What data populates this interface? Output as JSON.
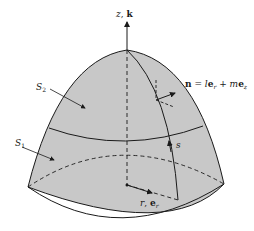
{
  "diagram": {
    "colors": {
      "surface_fill": "#c8c8c8",
      "lines": "#1a1a1a",
      "background": "#ffffff"
    },
    "labels": {
      "axis": "z, k",
      "axis_z": "z",
      "axis_k": "k",
      "normal": "n = le",
      "normal_full": "n = l e_r + m e_z",
      "normal_n": "n",
      "normal_eq": " = ",
      "normal_l": "l",
      "normal_e1": "e",
      "normal_sub_r": "r",
      "normal_plus": " + ",
      "normal_m": "m",
      "normal_e2": "e",
      "normal_sub_z": "z",
      "s2": "S",
      "s2_sub": "2",
      "s1": "S",
      "s1_sub": "1",
      "arc": "s",
      "radial_r": "r",
      "radial_comma": ", ",
      "radial_e": "e",
      "radial_sub": "r"
    }
  }
}
